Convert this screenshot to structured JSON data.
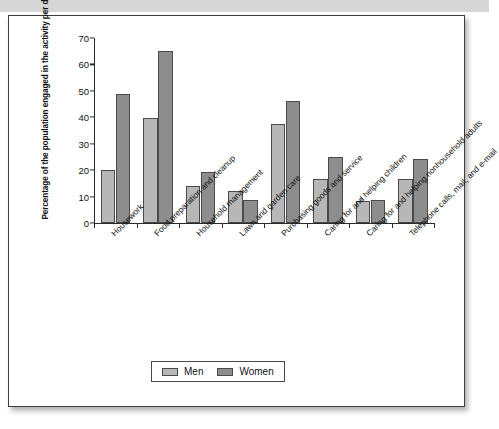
{
  "document": {
    "top_band_color": "#d6d6d6",
    "card_border_color": "#3c3c3c"
  },
  "chart_data": {
    "type": "bar",
    "title": "",
    "xlabel": "",
    "ylabel": "Percentage of the population engaged in the activity per day",
    "ylim": [
      0,
      70
    ],
    "yticks": [
      0,
      10,
      20,
      30,
      40,
      50,
      60,
      70
    ],
    "grid": false,
    "legend_position": "bottom-center",
    "categories": [
      "Housework",
      "Food preparation and cleanup",
      "Household management",
      "Lawn and garden care",
      "Purchasing goods and service",
      "Caring for and helping children",
      "Caring for and helping nonhousehold adults",
      "Telephone calls, mail, and e-mail"
    ],
    "series": [
      {
        "name": "Men",
        "color": "#b7b7b7",
        "values": [
          20,
          39.5,
          14,
          12,
          37.5,
          16.5,
          8,
          16.5
        ]
      },
      {
        "name": "Women",
        "color": "#8d8d8d",
        "values": [
          48.5,
          65,
          19,
          8.5,
          46,
          25,
          8.5,
          24
        ]
      }
    ]
  },
  "legend": {
    "items": [
      {
        "label": "Men"
      },
      {
        "label": "Women"
      }
    ]
  }
}
